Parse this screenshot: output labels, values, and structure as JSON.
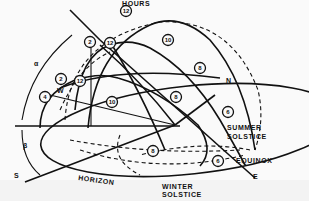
{
  "diagram": {
    "type": "sun path diagram",
    "labels": {
      "hours": "HOURS",
      "summer_solstice_1": "SUMMER",
      "summer_solstice_2": "SOLSTICE",
      "equinox": "EQUINOX",
      "winter_solstice_1": "WINTER",
      "winter_solstice_2": "SOLSTICE",
      "horizon": "HORIZON",
      "north": "N",
      "south": "S",
      "east": "E",
      "west": "W",
      "alpha": "α",
      "beta": "β"
    },
    "hour_markers": {
      "summer": [
        "2",
        "12",
        "10",
        "8",
        "6"
      ],
      "equinox": [
        "2",
        "12",
        "10",
        "8",
        "6"
      ],
      "winter": [
        "4",
        "2",
        "12",
        "10",
        "8",
        "6"
      ],
      "top_12": "12"
    },
    "colors": {
      "ink": "#111111",
      "background": "#fafafa"
    }
  }
}
